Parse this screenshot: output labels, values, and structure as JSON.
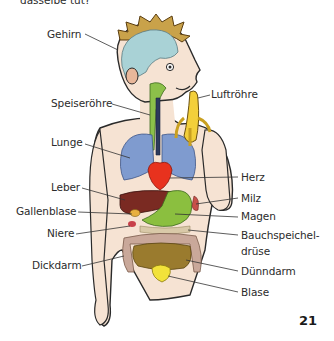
{
  "header": {
    "cut_text": "dasselbe tut?"
  },
  "figure": {
    "labels": {
      "gehirn": "Gehirn",
      "speiseroehre": "Speiseröhre",
      "luftroehre": "Luftröhre",
      "lunge": "Lunge",
      "herz": "Herz",
      "leber": "Leber",
      "milz": "Milz",
      "gallenblase": "Gallenblase",
      "magen": "Magen",
      "niere": "Niere",
      "bauchspeicheldruese_1": "Bauchspeichel-",
      "bauchspeicheldruese_2": "drüse",
      "duenndarm": "Dünndarm",
      "dickdarm": "Dickdarm",
      "blase": "Blase"
    },
    "colors": {
      "skin": "#f6e3d3",
      "brain": "#a9d2d6",
      "hair": "#c9a24a",
      "esophagus": "#8cc04a",
      "trachea": "#2d3a5c",
      "lungs": "#7f9bcf",
      "heart": "#e8321e",
      "liver": "#7a2a22",
      "stomach": "#8bbf3f",
      "intestine_small": "#9a7b2e",
      "intestine_large": "#c9a89a",
      "bladder": "#f2e23a",
      "banana": "#f3cf3a"
    }
  },
  "footer": {
    "page_number": "21"
  }
}
